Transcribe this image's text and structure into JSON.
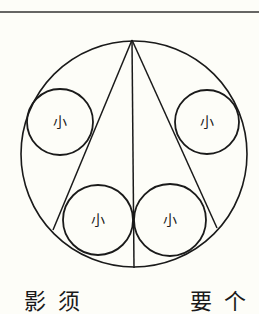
{
  "diagram": {
    "colors": {
      "background": "#fdfdf8",
      "stroke": "#1a1a1a"
    },
    "top_rule": {
      "x1": 0,
      "y1": 12,
      "x2": 259,
      "y2": 12
    },
    "outer_circle": {
      "cx": 134,
      "cy": 154,
      "r": 113
    },
    "apex": {
      "x": 132,
      "y": 40
    },
    "lines": [
      {
        "name": "left-chord",
        "x1": 132,
        "y1": 40,
        "x2": 53,
        "y2": 230
      },
      {
        "name": "center-line",
        "x1": 132,
        "y1": 40,
        "x2": 134,
        "y2": 268
      },
      {
        "name": "right-chord",
        "x1": 132,
        "y1": 40,
        "x2": 217,
        "y2": 228
      }
    ],
    "small_circles": [
      {
        "name": "upper-left",
        "cx": 60,
        "cy": 122,
        "r": 33,
        "label": "小"
      },
      {
        "name": "upper-right",
        "cx": 207,
        "cy": 122,
        "r": 32,
        "label": "小"
      },
      {
        "name": "lower-left",
        "cx": 98,
        "cy": 220,
        "r": 35,
        "label": "小"
      },
      {
        "name": "lower-right",
        "cx": 170,
        "cy": 220,
        "r": 36,
        "label": "小"
      }
    ]
  },
  "caption": {
    "left": "影须",
    "right": "要个"
  }
}
